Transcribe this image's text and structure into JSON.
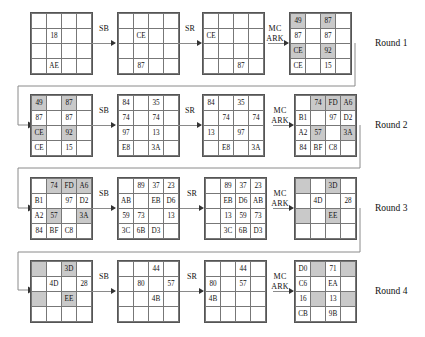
{
  "labels": {
    "sub_bytes": "SB",
    "shift_rows": "SR",
    "mix_columns_line1": "MC",
    "mix_columns_line2": "ARK"
  },
  "rounds": [
    {
      "name": "Round 1",
      "stages": [
        {
          "id": "r1-input",
          "cells": [
            [
              "",
              "",
              "",
              ""
            ],
            [
              "",
              "18",
              "",
              ""
            ],
            [
              "",
              "",
              "",
              ""
            ],
            [
              "",
              "AE",
              "",
              ""
            ]
          ],
          "shaded": []
        },
        {
          "id": "r1-sb",
          "cells": [
            [
              "",
              "",
              "",
              ""
            ],
            [
              "",
              "CE",
              "",
              ""
            ],
            [
              "",
              "",
              "",
              ""
            ],
            [
              "",
              "87",
              "",
              ""
            ]
          ],
          "shaded": []
        },
        {
          "id": "r1-sr",
          "cells": [
            [
              "",
              "",
              "",
              ""
            ],
            [
              "CE",
              "",
              "",
              ""
            ],
            [
              "",
              "",
              "",
              ""
            ],
            [
              "",
              "",
              "87",
              ""
            ]
          ],
          "shaded": []
        },
        {
          "id": "r1-mc-ark",
          "cells": [
            [
              "49",
              "",
              "87",
              ""
            ],
            [
              "87",
              "",
              "87",
              ""
            ],
            [
              "CE",
              "",
              "92",
              ""
            ],
            [
              "CE",
              "",
              "15",
              ""
            ]
          ],
          "shaded": [
            [
              0,
              0
            ],
            [
              0,
              2
            ],
            [
              2,
              0
            ],
            [
              2,
              2
            ]
          ]
        }
      ]
    },
    {
      "name": "Round 2",
      "stages": [
        {
          "id": "r2-input",
          "cells": [
            [
              "49",
              "",
              "87",
              ""
            ],
            [
              "87",
              "",
              "87",
              ""
            ],
            [
              "CE",
              "",
              "92",
              ""
            ],
            [
              "CE",
              "",
              "15",
              ""
            ]
          ],
          "shaded": [
            [
              0,
              0
            ],
            [
              0,
              2
            ],
            [
              2,
              0
            ],
            [
              2,
              2
            ]
          ]
        },
        {
          "id": "r2-sb",
          "cells": [
            [
              "84",
              "",
              "35",
              ""
            ],
            [
              "74",
              "",
              "74",
              ""
            ],
            [
              "97",
              "",
              "13",
              ""
            ],
            [
              "E8",
              "",
              "3A",
              ""
            ]
          ],
          "shaded": []
        },
        {
          "id": "r2-sr",
          "cells": [
            [
              "84",
              "",
              "35",
              ""
            ],
            [
              "",
              "74",
              "",
              "74"
            ],
            [
              "13",
              "",
              "97",
              ""
            ],
            [
              "",
              "E8",
              "",
              "3A"
            ]
          ],
          "shaded": []
        },
        {
          "id": "r2-mc-ark",
          "cells": [
            [
              "",
              "74",
              "FD",
              "A6"
            ],
            [
              "B1",
              "",
              "97",
              "D2"
            ],
            [
              "A2",
              "57",
              "",
              "3A"
            ],
            [
              "84",
              "BF",
              "C8",
              ""
            ]
          ],
          "shaded": [
            [
              0,
              1
            ],
            [
              0,
              2
            ],
            [
              0,
              3
            ],
            [
              2,
              1
            ],
            [
              2,
              3
            ]
          ]
        }
      ]
    },
    {
      "name": "Round 3",
      "stages": [
        {
          "id": "r3-input",
          "cells": [
            [
              "",
              "74",
              "FD",
              "A6"
            ],
            [
              "B1",
              "",
              "97",
              "D2"
            ],
            [
              "A2",
              "57",
              "",
              "3A"
            ],
            [
              "84",
              "BF",
              "C8",
              ""
            ]
          ],
          "shaded": [
            [
              0,
              1
            ],
            [
              0,
              2
            ],
            [
              0,
              3
            ],
            [
              2,
              1
            ],
            [
              2,
              3
            ]
          ]
        },
        {
          "id": "r3-sb",
          "cells": [
            [
              "",
              "89",
              "37",
              "23"
            ],
            [
              "AB",
              "",
              "EB",
              "D6"
            ],
            [
              "59",
              "73",
              "",
              "13"
            ],
            [
              "3C",
              "6B",
              "D3",
              ""
            ]
          ],
          "shaded": []
        },
        {
          "id": "r3-sr",
          "cells": [
            [
              "",
              "89",
              "37",
              "23"
            ],
            [
              "",
              "EB",
              "D6",
              "AB"
            ],
            [
              "",
              "13",
              "59",
              "73"
            ],
            [
              "",
              "3C",
              "6B",
              "D3"
            ]
          ],
          "shaded": []
        },
        {
          "id": "r3-mc-ark",
          "cells": [
            [
              "",
              "",
              "3D",
              ""
            ],
            [
              "",
              "4D",
              "",
              "28"
            ],
            [
              "",
              "",
              "EE",
              ""
            ],
            [
              "",
              "",
              "",
              ""
            ]
          ],
          "shaded": [
            [
              0,
              0
            ],
            [
              0,
              2
            ],
            [
              2,
              0
            ],
            [
              2,
              2
            ]
          ]
        }
      ]
    },
    {
      "name": "Round 4",
      "stages": [
        {
          "id": "r4-input",
          "cells": [
            [
              "",
              "",
              "3D",
              ""
            ],
            [
              "",
              "4D",
              "",
              "28"
            ],
            [
              "",
              "",
              "EE",
              ""
            ],
            [
              "",
              "",
              "",
              ""
            ]
          ],
          "shaded": [
            [
              0,
              0
            ],
            [
              0,
              2
            ],
            [
              2,
              0
            ],
            [
              2,
              2
            ]
          ]
        },
        {
          "id": "r4-sb",
          "cells": [
            [
              "",
              "",
              "44",
              ""
            ],
            [
              "",
              "80",
              "",
              "57"
            ],
            [
              "",
              "",
              "4B",
              ""
            ],
            [
              "",
              "",
              "",
              ""
            ]
          ],
          "shaded": []
        },
        {
          "id": "r4-sr",
          "cells": [
            [
              "",
              "",
              "44",
              ""
            ],
            [
              "80",
              "",
              "57",
              ""
            ],
            [
              "4B",
              "",
              "",
              ""
            ],
            [
              "",
              "",
              "",
              ""
            ]
          ],
          "shaded": []
        },
        {
          "id": "r4-mc-ark",
          "cells": [
            [
              "D0",
              "",
              "71",
              ""
            ],
            [
              "C6",
              "",
              "EA",
              ""
            ],
            [
              "16",
              "",
              "13",
              ""
            ],
            [
              "CB",
              "",
              "9B",
              ""
            ]
          ],
          "shaded": [
            [
              0,
              1
            ],
            [
              0,
              3
            ],
            [
              2,
              1
            ],
            [
              2,
              3
            ]
          ]
        }
      ]
    }
  ]
}
